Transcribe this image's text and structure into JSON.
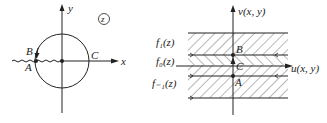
{
  "left_diagram": {
    "axis_x_label": "x",
    "axis_y_label": "y",
    "plane_label": "z",
    "points": {
      "A": "A",
      "B": "B",
      "C": "C"
    }
  },
  "right_diagram": {
    "axis_u_label": "u(x, y)",
    "axis_v_label": "v(x, y)",
    "branches": [
      "f₁(z)",
      "f₀(z)",
      "f₋₁(z)"
    ],
    "points": {
      "A": "A",
      "B": "B",
      "C": "C"
    }
  },
  "colors": {
    "ink": "#222222",
    "background": "#ffffff"
  }
}
